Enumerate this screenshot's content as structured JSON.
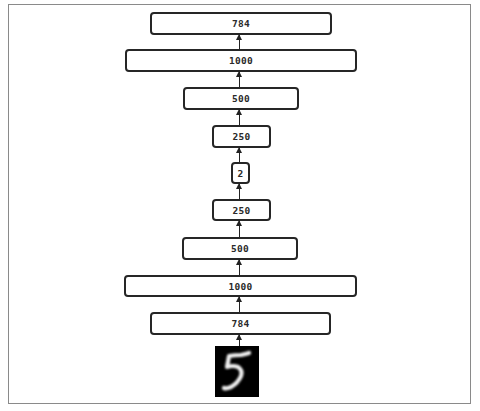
{
  "diagram": {
    "type": "autoencoder-architecture",
    "direction": "bottom-to-top",
    "input_image": {
      "label": "MNIST digit 5",
      "icon": "handwritten-digit-5"
    },
    "layers": [
      {
        "id": "input",
        "label": "784"
      },
      {
        "id": "encoder-1",
        "label": "1000"
      },
      {
        "id": "encoder-2",
        "label": "500"
      },
      {
        "id": "encoder-3",
        "label": "250"
      },
      {
        "id": "code",
        "label": "2"
      },
      {
        "id": "decoder-1",
        "label": "250"
      },
      {
        "id": "decoder-2",
        "label": "500"
      },
      {
        "id": "decoder-3",
        "label": "1000"
      },
      {
        "id": "output",
        "label": "784"
      }
    ],
    "colors": {
      "box_border": "#262626",
      "frame_border": "#8a8a8a",
      "background": "#ffffff",
      "image_background": "#000000"
    }
  }
}
